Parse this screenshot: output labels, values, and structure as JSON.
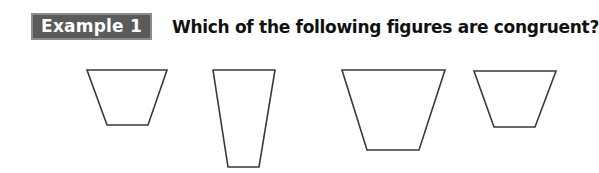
{
  "example": {
    "label": "Example 1",
    "question": "Which of the following figures are congruent?",
    "colors": {
      "label_fill": "#5b5b5b",
      "label_border": "#8c8c8c",
      "label_text": "#ffffff",
      "question_text": "#111111",
      "figure_stroke": "#3a3a3a"
    }
  },
  "figures": [
    {
      "id": "figure-1",
      "shape": "trapezoid",
      "points": "87,70 167,70 148,125 107,125"
    },
    {
      "id": "figure-2",
      "shape": "trapezoid",
      "points": "213,70 275,70 259,167 228,167"
    },
    {
      "id": "figure-3",
      "shape": "trapezoid",
      "points": "342,70 445,70 419,150 367,150"
    },
    {
      "id": "figure-4",
      "shape": "trapezoid",
      "points": "474,71 556,71 535,127 494,127"
    }
  ]
}
